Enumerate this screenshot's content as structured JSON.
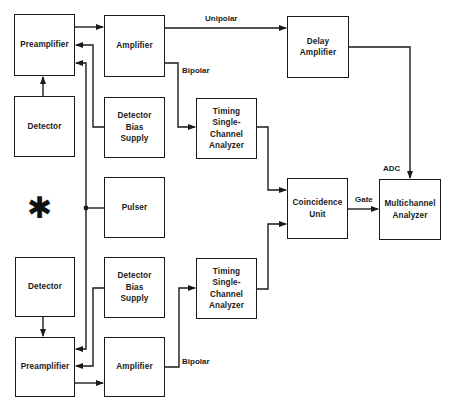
{
  "diagram": {
    "type": "block-diagram",
    "boxes": {
      "preamp_top": {
        "label": "Preamplifier"
      },
      "detector_top": {
        "label": "Detector"
      },
      "amp_top": {
        "label": "Amplifier"
      },
      "bias_top": {
        "label": "Detector\nBias\nSupply"
      },
      "pulser": {
        "label": "Pulser"
      },
      "delay_amp": {
        "label": "Delay\nAmplifier"
      },
      "tsca_top": {
        "label": "Timing\nSingle-\nChannel\nAnalyzer"
      },
      "coincidence": {
        "label": "Coincidence\nUnit"
      },
      "mca": {
        "label": "Multichannel\nAnalyzer"
      },
      "detector_bottom": {
        "label": "Detector"
      },
      "bias_bottom": {
        "label": "Detector\nBias\nSupply"
      },
      "tsca_bottom": {
        "label": "Timing\nSingle-\nChannel\nAnalyzer"
      },
      "preamp_bottom": {
        "label": "Preamplifier"
      },
      "amp_bottom": {
        "label": "Amplifier"
      }
    },
    "edge_labels": {
      "unipolar": "Unipolar",
      "bipolar_top": "Bipolar",
      "bipolar_bottom": "Bipolar",
      "adc": "ADC",
      "gate": "Gate"
    },
    "source_symbol": "✱",
    "colors": {
      "line": "#1a1a1a",
      "background": "#ffffff"
    }
  }
}
